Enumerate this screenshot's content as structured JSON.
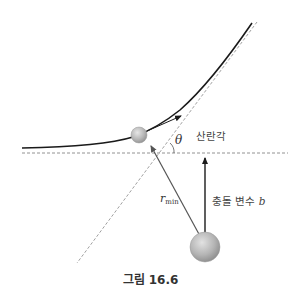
{
  "figure": {
    "caption": "그림 16.6",
    "labels": {
      "scattering_angle": "산란각",
      "theta": "θ",
      "impact_parameter": "충돌 변수",
      "impact_parameter_symbol": "b",
      "r_min": "r",
      "r_min_sub": "min"
    },
    "colors": {
      "trajectory": "#1a1a1a",
      "dashed": "#777777",
      "particle_fill": "#b9b9b9",
      "particle_edge": "#8a8a8a",
      "arrow": "#1a1a1a",
      "rmin_line": "#555555"
    }
  }
}
